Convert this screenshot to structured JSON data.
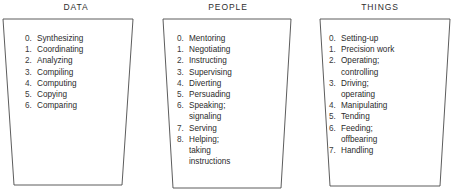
{
  "diagram": {
    "background_color": "#ffffff",
    "stroke_color": "#4a4a4a",
    "text_color": "#2b2b2b",
    "shape": "trapezoid-funnel",
    "columns": [
      {
        "id": "data",
        "title": "DATA",
        "items": [
          {
            "number": "0.",
            "lines": [
              "Synthesizing"
            ]
          },
          {
            "number": "1.",
            "lines": [
              "Coordinating"
            ]
          },
          {
            "number": "2.",
            "lines": [
              "Analyzing"
            ]
          },
          {
            "number": "3.",
            "lines": [
              "Compiling"
            ]
          },
          {
            "number": "4.",
            "lines": [
              "Computing"
            ]
          },
          {
            "number": "5.",
            "lines": [
              "Copying"
            ]
          },
          {
            "number": "6.",
            "lines": [
              "Comparing"
            ]
          }
        ]
      },
      {
        "id": "people",
        "title": "PEOPLE",
        "items": [
          {
            "number": "0.",
            "lines": [
              "Mentoring"
            ]
          },
          {
            "number": "1.",
            "lines": [
              "Negotiating"
            ]
          },
          {
            "number": "2.",
            "lines": [
              "Instructing"
            ]
          },
          {
            "number": "3.",
            "lines": [
              "Supervising"
            ]
          },
          {
            "number": "4.",
            "lines": [
              "Diverting"
            ]
          },
          {
            "number": "5.",
            "lines": [
              "Persuading"
            ]
          },
          {
            "number": "6.",
            "lines": [
              "Speaking;",
              "signaling"
            ]
          },
          {
            "number": "7.",
            "lines": [
              "Serving"
            ]
          },
          {
            "number": "8.",
            "lines": [
              "Helping;",
              "taking",
              "instructions"
            ]
          }
        ]
      },
      {
        "id": "things",
        "title": "THINGS",
        "items": [
          {
            "number": "0.",
            "lines": [
              "Setting-up"
            ]
          },
          {
            "number": "1.",
            "lines": [
              "Precision work"
            ]
          },
          {
            "number": "2.",
            "lines": [
              "Operating;",
              "controlling"
            ]
          },
          {
            "number": "3.",
            "lines": [
              "Driving;",
              "operating"
            ]
          },
          {
            "number": "4.",
            "lines": [
              "Manipulating"
            ]
          },
          {
            "number": "5.",
            "lines": [
              "Tending"
            ]
          },
          {
            "number": "6.",
            "lines": [
              "Feeding;",
              "offbearing"
            ]
          },
          {
            "number": "7.",
            "lines": [
              "Handling"
            ]
          }
        ]
      }
    ]
  }
}
